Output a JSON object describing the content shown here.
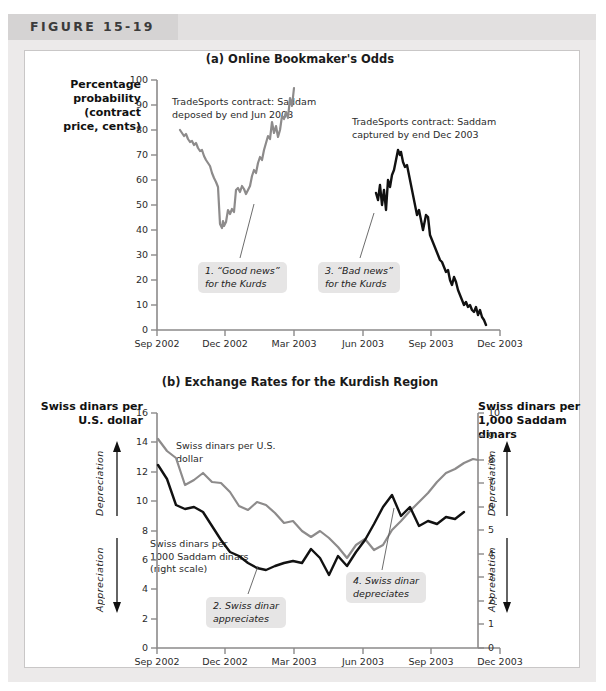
{
  "figure": {
    "label": "FIGURE 15-19",
    "band_color": "#e2e0e0",
    "frame_color": "#c9c7c7"
  },
  "panel_a": {
    "title": "(a) Online Bookmaker's Odds",
    "ylabel": "Percentage probability (contract price, cents)",
    "notes": [
      "TradeSports contract: Saddam deposed by end Jun 2003",
      "TradeSports contract: Saddam captured by end Dec 2003"
    ],
    "callouts": [
      "1. “Good news” for the Kurds",
      "3. “Bad news” for the Kurds"
    ]
  },
  "panel_b": {
    "title": "(b) Exchange Rates for the Kurdish Region",
    "ylabel_left": "Swiss dinars per U.S. dollar",
    "ylabel_right": "Swiss dinars per 1,000 Saddam dinars",
    "series_labels": [
      "Swiss dinars per U.S. dollar",
      "Swiss dinars per 1000 Saddam dinars (right scale)"
    ],
    "direction_labels": {
      "up": "Depreciation",
      "down": "Appreciation"
    },
    "callouts": [
      "2. Swiss dinar appreciates",
      "4. Swiss dinar depreciates"
    ]
  },
  "chart_data": [
    {
      "type": "line",
      "title": "(a) Online Bookmaker's Odds",
      "ylabel": "Percentage probability (contract price, cents)",
      "xlabel": "",
      "ylim": [
        0,
        100
      ],
      "yticks": [
        0,
        10,
        20,
        30,
        40,
        50,
        60,
        70,
        80,
        90,
        100
      ],
      "xticks": [
        "Sep 2002",
        "Dec 2002",
        "Mar 2003",
        "Jun 2003",
        "Sep 2003",
        "Dec 2003"
      ],
      "grid": false,
      "legend": "none",
      "series": [
        {
          "name": "TradeSports contract: Saddam deposed by end Jun 2003",
          "color": "#8d8b8b",
          "x_start": "Oct 2002",
          "x_end": "Apr 2003",
          "values": [
            80,
            78,
            76,
            77,
            74,
            72,
            73,
            70,
            71,
            68,
            66,
            67,
            63,
            60,
            57,
            55,
            50,
            47,
            44,
            40,
            36,
            34,
            37,
            35,
            38,
            42,
            40,
            43,
            41,
            56,
            57,
            54,
            58,
            56,
            52,
            55,
            58,
            62,
            66,
            64,
            70,
            74,
            72,
            78,
            82,
            86,
            84,
            92,
            86,
            90,
            84,
            88,
            94,
            92,
            97,
            93,
            100
          ]
        },
        {
          "name": "TradeSports contract: Saddam captured by end Dec 2003",
          "color": "#111111",
          "x_start": "Jul 2003",
          "x_end": "Dec 2003",
          "values": [
            55,
            52,
            58,
            50,
            56,
            48,
            60,
            57,
            62,
            64,
            68,
            72,
            70,
            71,
            67,
            65,
            66,
            62,
            58,
            54,
            50,
            46,
            48,
            44,
            40,
            42,
            46,
            45,
            38,
            36,
            34,
            32,
            30,
            28,
            27,
            25,
            23,
            24,
            20,
            18,
            21,
            19,
            16,
            14,
            12,
            10,
            11,
            9,
            10,
            8,
            7,
            9,
            6,
            8,
            5,
            4,
            2
          ]
        }
      ]
    },
    {
      "type": "line",
      "title": "(b) Exchange Rates for the Kurdish Region",
      "ylabel_left": "Swiss dinars per U.S. dollar",
      "ylabel_right": "Swiss dinars per 1,000 Saddam dinars",
      "ylim_left": [
        0,
        16
      ],
      "ylim_right": [
        0,
        10
      ],
      "yticks_left": [
        0,
        2,
        4,
        6,
        8,
        10,
        12,
        14,
        16
      ],
      "yticks_right": [
        0,
        1,
        2,
        3,
        4,
        5,
        6,
        7,
        8,
        9,
        10
      ],
      "xticks": [
        "Sep 2002",
        "Dec 2002",
        "Mar 2003",
        "Jun 2003",
        "Sep 2003",
        "Dec 2003"
      ],
      "grid": false,
      "legend": "inline-labels",
      "series": [
        {
          "name": "Swiss dinars per U.S. dollar",
          "color": "#8d8b8b",
          "axis": "left",
          "values": [
            14.2,
            13.4,
            12.9,
            11.1,
            11.4,
            11.9,
            11.3,
            11.2,
            10.6,
            9.8,
            9.5,
            10.1,
            9.9,
            9.4,
            8.7,
            8.9,
            8.2,
            7.8,
            8.2,
            7.7,
            7.1,
            6.4,
            7.3,
            7.7,
            6.9,
            7.3,
            8.3,
            8.9,
            9.6,
            10.2,
            10.8,
            11.6,
            12.2,
            12.5,
            12.9,
            13.2,
            13.1
          ]
        },
        {
          "name": "Swiss dinars per 1000 Saddam dinars (right scale)",
          "color": "#111111",
          "axis": "right",
          "values": [
            7.8,
            7.2,
            6.1,
            5.9,
            6.0,
            5.8,
            5.2,
            4.6,
            4.1,
            3.9,
            3.6,
            3.4,
            3.3,
            3.5,
            3.6,
            3.7,
            3.6,
            4.2,
            3.8,
            3.1,
            3.9,
            3.5,
            4.1,
            4.6,
            5.3,
            6.0,
            6.5,
            5.6,
            6.0,
            5.2,
            5.4,
            5.3,
            5.6,
            5.5,
            5.8
          ]
        }
      ]
    }
  ]
}
